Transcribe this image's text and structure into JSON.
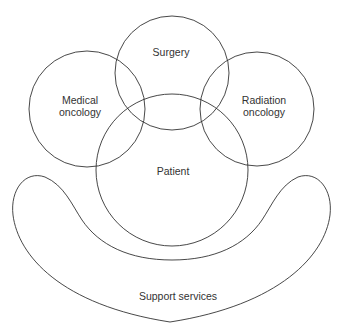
{
  "diagram": {
    "nodes": {
      "surgery": {
        "label": "Surgery"
      },
      "medical": {
        "line1": "Medical",
        "line2": "oncology"
      },
      "radiation": {
        "line1": "Radiation",
        "line2": "oncology"
      },
      "patient": {
        "label": "Patient"
      },
      "support": {
        "label": "Support services"
      }
    },
    "stroke_color": "#333333"
  }
}
